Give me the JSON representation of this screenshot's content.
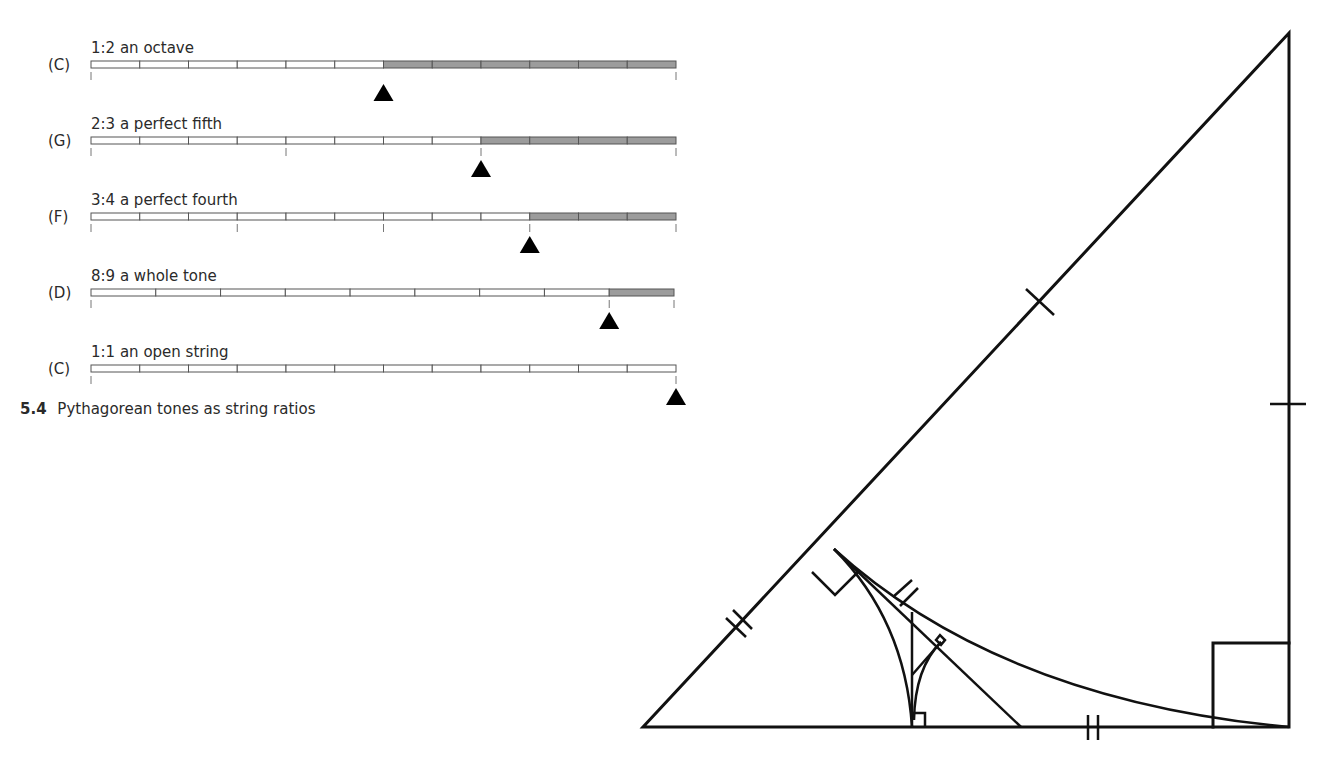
{
  "figure": {
    "caption_number": "5.4",
    "caption_text": "Pythagorean tones as string ratios"
  },
  "strings": [
    {
      "note": "(C)",
      "label": "1:2 an octave",
      "ratio": [
        1,
        2
      ],
      "segments": 12,
      "shaded_from": 6,
      "ticks": [
        0,
        12
      ],
      "marker_at": 6
    },
    {
      "note": "(G)",
      "label": "2:3 a perfect fifth",
      "ratio": [
        2,
        3
      ],
      "segments": 12,
      "shaded_from": 8,
      "ticks": [
        0,
        4,
        8,
        12
      ],
      "marker_at": 8
    },
    {
      "note": "(F)",
      "label": "3:4 a perfect fourth",
      "ratio": [
        3,
        4
      ],
      "segments": 12,
      "shaded_from": 9,
      "ticks": [
        0,
        3,
        6,
        9,
        12
      ],
      "marker_at": 9
    },
    {
      "note": "(D)",
      "label": "8:9 a whole tone",
      "ratio": [
        8,
        9
      ],
      "segments": 9,
      "shaded_from": 8,
      "ticks": [
        0,
        8,
        9
      ],
      "marker_at": 8
    },
    {
      "note": "(C)",
      "label": "1:1 an open string",
      "ratio": [
        1,
        1
      ],
      "segments": 12,
      "shaded_from": 12,
      "ticks": [
        0,
        12
      ],
      "marker_at": 12
    }
  ],
  "geometry": {
    "description": "Right triangle with altitude construction, arcs, right-angle markers and congruence tick marks",
    "colors": {
      "stroke": "#111111",
      "shade": "#9c9c9c"
    }
  }
}
